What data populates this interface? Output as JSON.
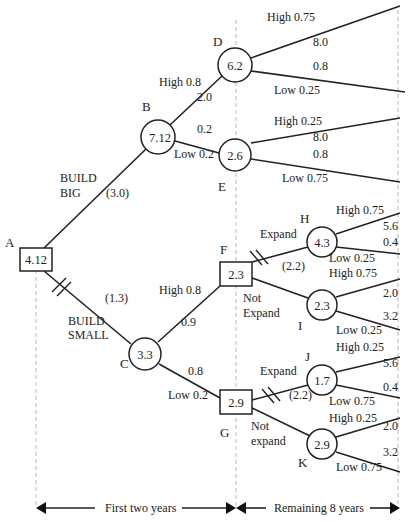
{
  "diagram": {
    "type": "decision-tree",
    "nodes": {
      "A": {
        "label": "A",
        "value": "4.12",
        "shape": "decision"
      },
      "B": {
        "label": "B",
        "value": "7.12",
        "shape": "chance"
      },
      "C": {
        "label": "C",
        "value": "3.3",
        "shape": "chance"
      },
      "D": {
        "label": "D",
        "value": "6.2",
        "shape": "chance"
      },
      "E": {
        "label": "E",
        "value": "2.6",
        "shape": "chance"
      },
      "F": {
        "label": "F",
        "value": "2.3",
        "shape": "decision"
      },
      "G": {
        "label": "G",
        "value": "2.9",
        "shape": "decision"
      },
      "H": {
        "label": "H",
        "value": "4.3",
        "shape": "chance"
      },
      "I": {
        "label": "I",
        "value": "2.3",
        "shape": "chance"
      },
      "J": {
        "label": "J",
        "value": "1.7",
        "shape": "chance"
      },
      "K": {
        "label": "K",
        "value": "2.9",
        "shape": "chance"
      }
    },
    "edges": {
      "build_big": {
        "line1": "BUILD",
        "line2": "BIG",
        "cost": "(3.0)"
      },
      "build_small": {
        "line1": "BUILD",
        "line2": "SMALL",
        "cost": "(1.3)"
      },
      "b_high": {
        "label": "High 0.8",
        "payoff": "2.0"
      },
      "b_low": {
        "label": "Low 0.2",
        "payoff": "0.2"
      },
      "c_high": {
        "label": "High 0.8",
        "payoff": "0.9"
      },
      "c_low": {
        "label": "Low 0.2",
        "payoff": "0.8"
      },
      "d_high": {
        "label": "High 0.75",
        "payoff": "8.0"
      },
      "d_low": {
        "label": "Low 0.25",
        "payoff": "0.8"
      },
      "e_high": {
        "label": "High 0.25",
        "payoff": "8.0"
      },
      "e_low": {
        "label": "Low 0.75",
        "payoff": "0.8"
      },
      "f_expand": {
        "label": "Expand",
        "cost": "(2.2)"
      },
      "f_not_expand": {
        "line1": "Not",
        "line2": "Expand"
      },
      "g_expand": {
        "label": "Expand",
        "cost": "(2.2)"
      },
      "g_not_expand": {
        "line1": "Not",
        "line2": "expand"
      },
      "h_high": {
        "label": "High 0.75",
        "payoff": "5.6"
      },
      "h_low": {
        "label": "Low 0.25",
        "payoff": "0.4"
      },
      "i_high": {
        "label": "High 0.75",
        "payoff": "2.0"
      },
      "i_low": {
        "label": "Low 0.25",
        "payoff": "3.2"
      },
      "j_high": {
        "label": "High 0.25",
        "payoff": "5.6"
      },
      "j_low": {
        "label": "Low 0.75",
        "payoff": "0.4"
      },
      "k_high": {
        "label": "High 0.25",
        "payoff": "2.0"
      },
      "k_low": {
        "label": "Low 0.75",
        "payoff": "3.2"
      }
    },
    "timeline": {
      "period1": "First two years",
      "period2": "Remaining 8 years"
    },
    "colors": {
      "line": "#222222",
      "guide": "#b8b8b8",
      "background": "#ffffff"
    }
  }
}
